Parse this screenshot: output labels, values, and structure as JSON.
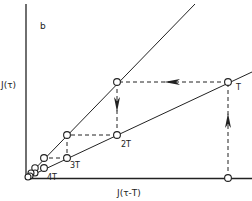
{
  "diagram": {
    "panel_label": "b",
    "y_axis_label": "J(τ)",
    "x_axis_label": "J(τ-T)",
    "lines": [
      {
        "name": "identity-diagonal",
        "description": "J(τ) = J(τ-T)"
      },
      {
        "name": "map-line",
        "description": "shallower iteration line"
      }
    ],
    "points": [
      {
        "label": "T"
      },
      {
        "label": "2T"
      },
      {
        "label": "3T"
      },
      {
        "label": "4T"
      }
    ],
    "colors": {
      "ink": "#222222",
      "background": "#ffffff"
    }
  }
}
